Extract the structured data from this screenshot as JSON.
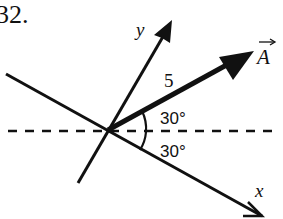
{
  "problem": {
    "number": "32."
  },
  "diagram": {
    "origin": [
      108,
      130
    ],
    "axes": {
      "x_label": "x",
      "y_label": "y",
      "x_axis_angle_below_horizontal_deg": 30
    },
    "vector": {
      "name": "A",
      "magnitude_label": "5",
      "angle_above_horizontal_deg": 30
    },
    "angle_labels": {
      "upper": "30°",
      "lower": "30°"
    },
    "reference_line": "dashed horizontal",
    "colors": {
      "ink": "#111111",
      "background": "#ffffff"
    }
  }
}
